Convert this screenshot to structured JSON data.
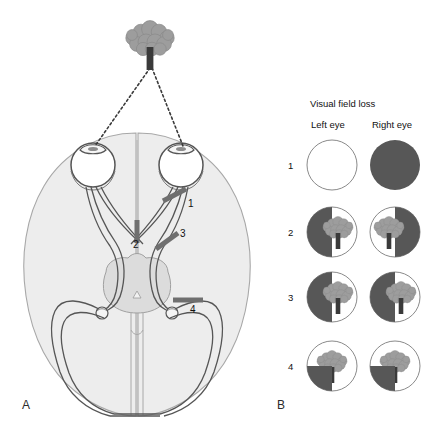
{
  "figure": {
    "panels": [
      {
        "id": "A",
        "label": "A",
        "name": "panel-a-anatomy"
      },
      {
        "id": "B",
        "label": "B",
        "name": "panel-b-fields"
      }
    ]
  },
  "anatomy": {
    "stimulus": {
      "name": "tree-stimulus",
      "description": "tree"
    },
    "sight_lines": {
      "name": "lines-of-sight",
      "style": "dotted"
    },
    "structures": [
      "left-eye",
      "right-eye",
      "left-optic-nerve",
      "right-optic-nerve",
      "optic-chiasm",
      "left-optic-tract",
      "right-optic-tract",
      "left-lateral-geniculate",
      "right-lateral-geniculate",
      "left-optic-radiation",
      "right-optic-radiation",
      "brainstem",
      "occipital-cortex"
    ],
    "lesions": [
      {
        "id": 1,
        "label": "1",
        "site": "right-optic-nerve",
        "x": 188,
        "y": 205
      },
      {
        "id": 2,
        "label": "2",
        "site": "optic-chiasm",
        "x": 132,
        "y": 245
      },
      {
        "id": 3,
        "label": "3",
        "site": "right-optic-tract",
        "x": 177,
        "y": 235
      },
      {
        "id": 4,
        "label": "4",
        "site": "right-optic-radiation",
        "x": 197,
        "y": 313
      }
    ]
  },
  "fields": {
    "title": "Visual field loss",
    "columns": [
      {
        "key": "left",
        "label": "Left eye"
      },
      {
        "key": "right",
        "label": "Right eye"
      }
    ],
    "rows": [
      {
        "num": "1",
        "left": "normal",
        "right": "blind"
      },
      {
        "num": "2",
        "left": "dark-left",
        "right": "dark-right"
      },
      {
        "num": "3",
        "left": "dark-left",
        "right": "dark-left"
      },
      {
        "num": "4",
        "left": "dark-lower-left",
        "right": "dark-lower-left"
      }
    ]
  },
  "colors": {
    "field_dark": "#575757",
    "brain_fill": "#ededed",
    "brain_stroke": "#9a9a9a",
    "brainstem_fill": "#dcdcdc",
    "tree_canopy": "#9d9d9d",
    "tree_trunk": "#3a3a3a",
    "lesion_bar": "#6f6f6f",
    "pathway_stroke": "#555555",
    "text": "#111111"
  }
}
